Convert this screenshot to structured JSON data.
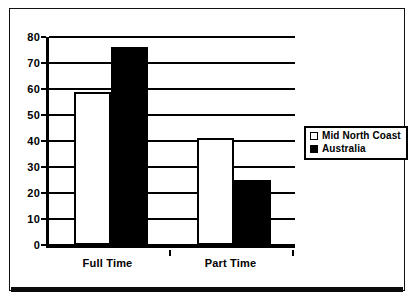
{
  "chart_data": {
    "type": "bar",
    "title": "",
    "subtitle": "",
    "xlabel": "",
    "ylabel": "",
    "categories": [
      "Full Time",
      "Part Time"
    ],
    "series": [
      {
        "name": "Mid North Coast",
        "values": [
          59,
          41
        ],
        "swatch": "light",
        "color": "#ffffff"
      },
      {
        "name": "Australia",
        "values": [
          76,
          25
        ],
        "swatch": "dark",
        "color": "#000000"
      }
    ],
    "ylim": [
      0,
      80
    ],
    "ytick_step": 10,
    "yticks": [
      0,
      10,
      20,
      30,
      40,
      50,
      60,
      70,
      80
    ],
    "ytick_labels": [
      "0",
      "10",
      "20",
      "30",
      "40",
      "50",
      "60",
      "70",
      "80"
    ],
    "grid": true,
    "grid_axis": "y",
    "legend_position": "right",
    "frame_color": "#000000",
    "background_color": "#ffffff"
  },
  "legend": {
    "items": [
      {
        "label": "Mid North Coast",
        "swatch": "light"
      },
      {
        "label": "Australia",
        "swatch": "dark"
      }
    ]
  }
}
